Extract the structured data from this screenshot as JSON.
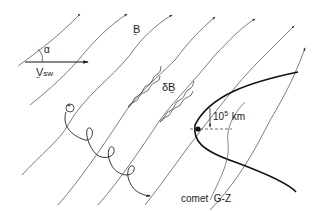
{
  "diagram": {
    "labels": {
      "alpha": "α",
      "v_sw": "V",
      "v_sw_sub": "sw",
      "b_field": "B",
      "delta_b": "δB",
      "scale_base": "10",
      "scale_exp": "5",
      "scale_unit": "km",
      "ion_charge": "+",
      "comet_name": "comet  G-Z"
    },
    "elements": {
      "field_lines": "solar-wind magnetic field lines with arrows pointing up-right",
      "velocity_vector": "solar wind velocity arrow pointing right",
      "angle": "angle α between field and solar wind velocity",
      "ion_trajectory": "cycloidal gyrating ion path starting at + marker",
      "waves": "wavy δB field perturbations along two field lines",
      "bow_shock": "bold parabolic bow shock around comet",
      "nucleus": "comet nucleus dot",
      "scale_bar": "10^5 km vertical scale marker"
    },
    "colors": {
      "line": "#333333",
      "bold_line": "#111111",
      "background": "#ffffff"
    }
  }
}
